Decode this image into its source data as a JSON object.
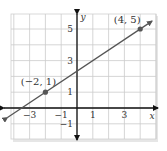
{
  "chart_data": {
    "type": "line",
    "title": "",
    "xlabel": "x",
    "ylabel": "y",
    "xlim": [
      -4.2,
      5
    ],
    "ylim": [
      -2,
      6
    ],
    "grid": true,
    "x_ticks": [
      -3,
      -1,
      1,
      3
    ],
    "x_tick_labels": [
      "−3",
      "−1",
      "1",
      "3"
    ],
    "y_ticks": [
      -1,
      1,
      3,
      5
    ],
    "y_tick_labels": [
      "−1",
      "1",
      "3",
      "5"
    ],
    "series": [
      {
        "name": "line through (-2,1) and (4,5)",
        "slope": 0.6667,
        "intercept": 2.3333,
        "points": [
          {
            "x": -2,
            "y": 1,
            "label": "(−2, 1)"
          },
          {
            "x": 4,
            "y": 5,
            "label": "(4, 5)"
          }
        ]
      }
    ],
    "colors": {
      "line": "#555555",
      "point": "#555555",
      "axis": "#111111",
      "grid": "#cccccc"
    }
  }
}
